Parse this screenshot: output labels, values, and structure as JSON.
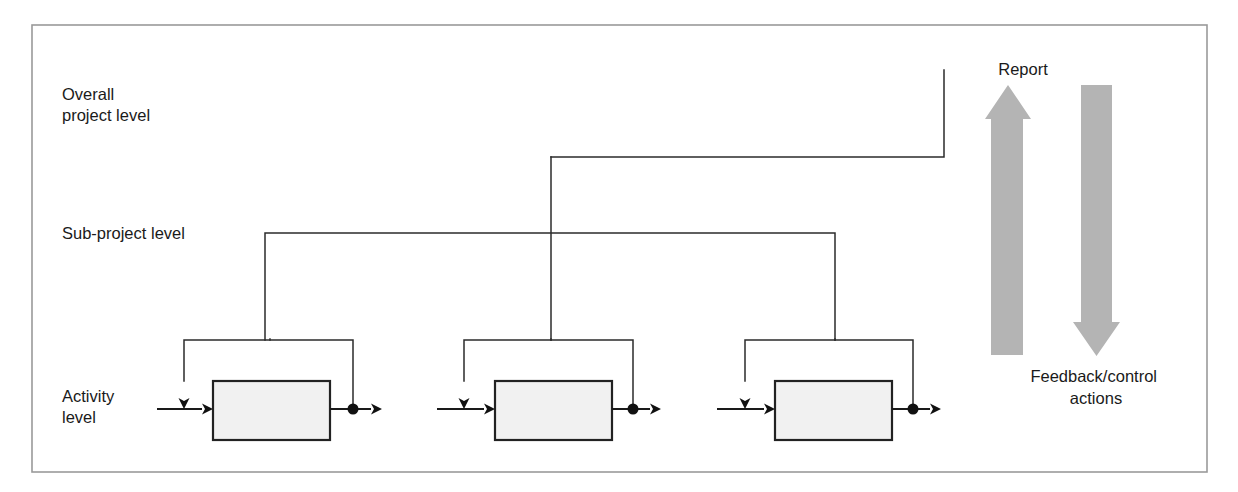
{
  "diagram": {
    "frame": {
      "x": 32,
      "y": 25,
      "width": 1175,
      "height": 447,
      "stroke": "#9a9a9a"
    },
    "colors": {
      "line": "#2b2b2b",
      "flow": "#1a1a1a",
      "box_fill": "#f1f1f1",
      "box_stroke": "#222222",
      "dot": "#111111",
      "block_arrow": "#b4b4b4",
      "text": "#1a1a1a",
      "background": "#ffffff"
    },
    "levels": [
      {
        "id": "overall-project-level",
        "label_line1": "Overall",
        "label_line2": "project level",
        "label_x": 62,
        "label_y": 100,
        "rail_y": 157
      },
      {
        "id": "sub-project-level",
        "label_line1": "Sub-project level",
        "label_line2": "",
        "label_x": 62,
        "label_y": 239,
        "rail_y": 233
      },
      {
        "id": "activity-level",
        "label_line1": "Activity",
        "label_line2": "level",
        "label_x": 62,
        "label_y": 402,
        "rail_y": 340
      }
    ],
    "overall_rail": {
      "from_x": 551,
      "to_x": 944,
      "y": 157,
      "riser_top_y": 70,
      "riser_x": 944
    },
    "sub_rail": {
      "from_x": 265,
      "to_x": 835,
      "y": 233,
      "stem_x": 551,
      "stem_top_y": 157,
      "stem_bottom_y": 340,
      "left_leg_bottom_y": 340,
      "right_leg_bottom_y": 340
    },
    "activity_units": [
      {
        "id": "activity-unit-1",
        "input_start_x": 157,
        "control_drop_x": 184,
        "box_x": 213,
        "box_y": 381,
        "box_width": 117,
        "box_height": 59,
        "dot_x": 353,
        "output_end_x": 382,
        "bracket_y": 340,
        "bracket_left_x": 184,
        "bracket_right_x": 353,
        "stem_x": 270,
        "flow_y": 409
      },
      {
        "id": "activity-unit-2",
        "input_start_x": 437,
        "control_drop_x": 464,
        "box_x": 495,
        "box_y": 381,
        "box_width": 117,
        "box_height": 59,
        "dot_x": 633,
        "output_end_x": 661,
        "bracket_y": 340,
        "bracket_left_x": 464,
        "bracket_right_x": 633,
        "stem_x": 551,
        "flow_y": 409
      },
      {
        "id": "activity-unit-3",
        "input_start_x": 717,
        "control_drop_x": 745,
        "box_x": 775,
        "box_y": 381,
        "box_width": 117,
        "box_height": 59,
        "dot_x": 913,
        "output_end_x": 941,
        "bracket_y": 340,
        "bracket_left_x": 745,
        "bracket_right_x": 913,
        "stem_x": 835,
        "flow_y": 409
      }
    ],
    "block_arrows": [
      {
        "id": "report-arrow",
        "direction": "up",
        "label": "Report",
        "label_x": 1023,
        "label_y": 75,
        "shaft_left_x": 991,
        "shaft_right_x": 1023,
        "head_left_x": 985,
        "head_right_x": 1031,
        "tip_y": 85,
        "head_base_y": 119,
        "base_y": 355
      },
      {
        "id": "feedback-control-arrow",
        "direction": "down",
        "label_line1": "Feedback/control",
        "label_line2": "actions",
        "label_x": 1096,
        "label_y1": 382,
        "label_y2": 404,
        "shaft_left_x": 1081,
        "shaft_right_x": 1112,
        "head_left_x": 1073,
        "head_right_x": 1120,
        "tip_y": 356,
        "head_base_y": 322,
        "base_y": 85
      }
    ]
  }
}
